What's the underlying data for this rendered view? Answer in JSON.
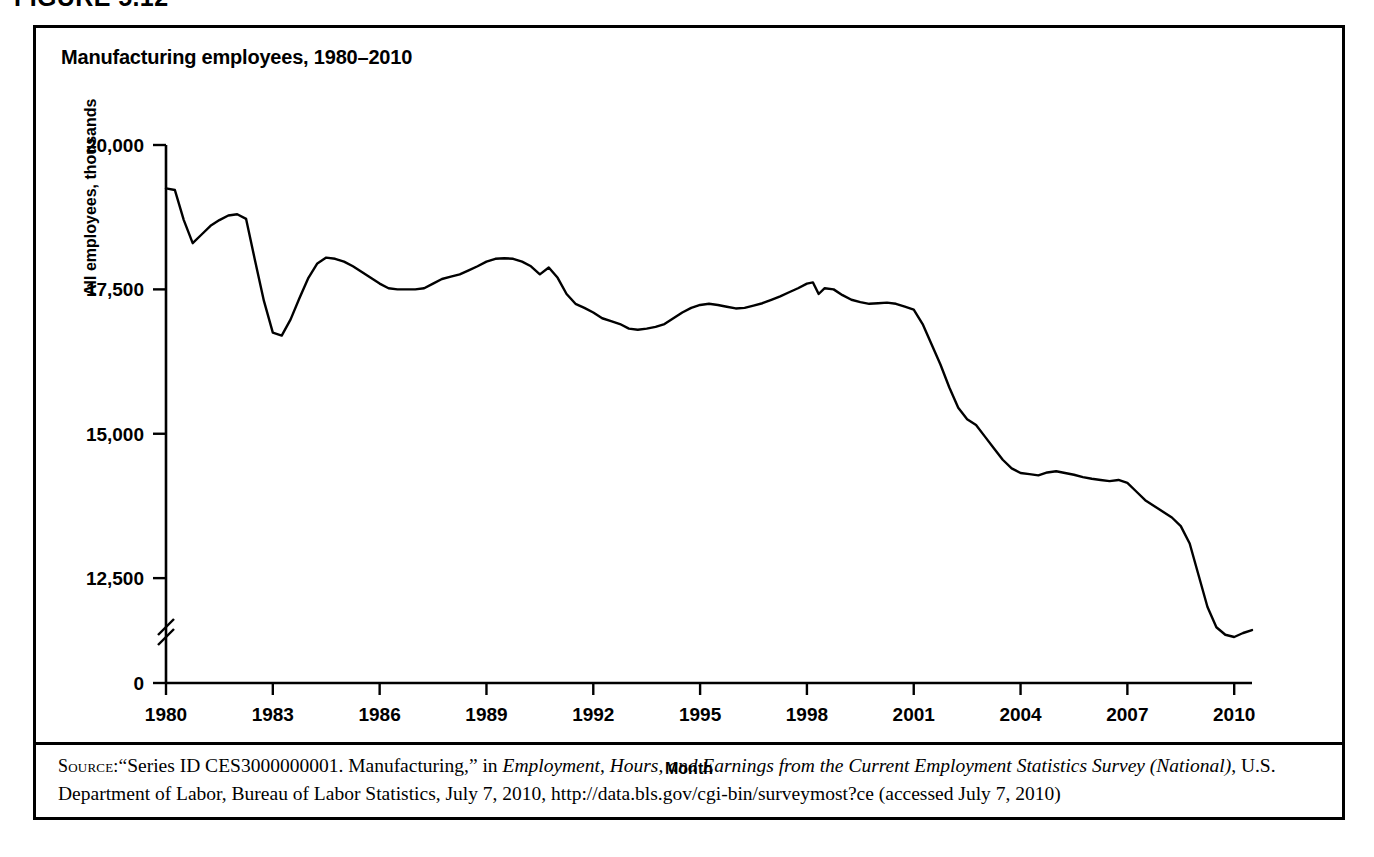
{
  "figure": {
    "number_label": "FIGURE 5.12"
  },
  "chart_title": "Manufacturing employees, 1980–2010",
  "axis": {
    "xlabel": "Month",
    "ylabel": "All employees, thousands",
    "y_ticks": [
      "20,000",
      "17,500",
      "15,000",
      "12,500",
      "0"
    ],
    "x_ticks": [
      "1980",
      "1983",
      "1986",
      "1989",
      "1992",
      "1995",
      "1998",
      "2001",
      "2004",
      "2007",
      "2010"
    ],
    "axis_break": true
  },
  "source": {
    "label": "Source:",
    "line1_a": "“Series ID CES3000000001. Manufacturing,” in ",
    "line1_italic": "Employment, Hours, and Earnings from the Current Employment Statistics Survey (National)",
    "line1_b": ", U.S. Department of Labor, Bureau of Labor Statistics, July 7, 2010, http://data.bls.gov/cgi-bin/surveymost?ce (accessed July 7, 2010)"
  },
  "chart_data": {
    "type": "line",
    "title": "Manufacturing employees, 1980–2010",
    "xlabel": "Month",
    "ylabel": "All employees, thousands",
    "grid": false,
    "legend": null,
    "line_color": "#000000",
    "xlim": [
      1980.0,
      2010.5
    ],
    "ylim": [
      11000,
      20000
    ],
    "y_axis_break_below": 12500,
    "y_ticks": [
      12500,
      15000,
      17500,
      20000
    ],
    "x_ticks": [
      1980,
      1983,
      1986,
      1989,
      1992,
      1995,
      1998,
      2001,
      2004,
      2007,
      2010
    ],
    "x_unit": "year (monthly observations)",
    "series": [
      {
        "name": "All employees, manufacturing (thousands)",
        "x": [
          1980.0,
          1980.25,
          1980.5,
          1980.75,
          1981.0,
          1981.25,
          1981.5,
          1981.75,
          1982.0,
          1982.25,
          1982.5,
          1982.75,
          1983.0,
          1983.25,
          1983.5,
          1983.75,
          1984.0,
          1984.25,
          1984.5,
          1984.75,
          1985.0,
          1985.25,
          1985.5,
          1985.75,
          1986.0,
          1986.25,
          1986.5,
          1986.75,
          1987.0,
          1987.25,
          1987.5,
          1987.75,
          1988.0,
          1988.25,
          1988.5,
          1988.75,
          1989.0,
          1989.25,
          1989.5,
          1989.75,
          1990.0,
          1990.25,
          1990.5,
          1990.75,
          1991.0,
          1991.25,
          1991.5,
          1991.75,
          1992.0,
          1992.25,
          1992.5,
          1992.75,
          1993.0,
          1993.25,
          1993.5,
          1993.75,
          1994.0,
          1994.25,
          1994.5,
          1994.75,
          1995.0,
          1995.25,
          1995.5,
          1995.75,
          1996.0,
          1996.25,
          1996.5,
          1996.75,
          1997.0,
          1997.25,
          1997.5,
          1997.75,
          1998.0,
          1998.17,
          1998.33,
          1998.5,
          1998.75,
          1999.0,
          1999.25,
          1999.5,
          1999.75,
          2000.0,
          2000.25,
          2000.5,
          2000.75,
          2001.0,
          2001.25,
          2001.5,
          2001.75,
          2002.0,
          2002.25,
          2002.5,
          2002.75,
          2003.0,
          2003.25,
          2003.5,
          2003.75,
          2004.0,
          2004.25,
          2004.5,
          2004.75,
          2005.0,
          2005.25,
          2005.5,
          2005.75,
          2006.0,
          2006.25,
          2006.5,
          2006.75,
          2007.0,
          2007.25,
          2007.5,
          2007.75,
          2008.0,
          2008.25,
          2008.5,
          2008.75,
          2009.0,
          2009.25,
          2009.5,
          2009.75,
          2010.0,
          2010.25,
          2010.5
        ],
        "y": [
          19250,
          19220,
          18700,
          18300,
          18450,
          18600,
          18700,
          18780,
          18800,
          18720,
          18000,
          17300,
          16750,
          16700,
          16980,
          17350,
          17700,
          17950,
          18050,
          18030,
          17980,
          17900,
          17800,
          17700,
          17600,
          17520,
          17500,
          17500,
          17500,
          17520,
          17600,
          17680,
          17720,
          17760,
          17830,
          17900,
          17980,
          18030,
          18040,
          18030,
          17980,
          17900,
          17760,
          17880,
          17700,
          17420,
          17250,
          17180,
          17100,
          17000,
          16950,
          16900,
          16820,
          16800,
          16820,
          16850,
          16900,
          17000,
          17100,
          17180,
          17230,
          17250,
          17230,
          17200,
          17170,
          17180,
          17220,
          17260,
          17320,
          17380,
          17450,
          17520,
          17600,
          17620,
          17420,
          17520,
          17500,
          17400,
          17320,
          17280,
          17250,
          17260,
          17270,
          17250,
          17200,
          17150,
          16900,
          16550,
          16200,
          15800,
          15450,
          15250,
          15150,
          14950,
          14750,
          14550,
          14400,
          14320,
          14300,
          14280,
          14330,
          14350,
          14320,
          14290,
          14250,
          14220,
          14200,
          14180,
          14200,
          14150,
          14000,
          13850,
          13750,
          13650,
          13550,
          13400,
          13100,
          12550,
          12000,
          11650,
          11520,
          11480,
          11550,
          11600
        ]
      }
    ],
    "annotations": [
      {
        "text": "1982–83 recession trough ≈ 16,700",
        "x": 1983.2
      },
      {
        "text": "late-1990s plateau ≈ 17,200–17,600",
        "x": 1998.0
      },
      {
        "text": "2009 trough ≈ 11,500",
        "x": 2009.8
      }
    ]
  }
}
